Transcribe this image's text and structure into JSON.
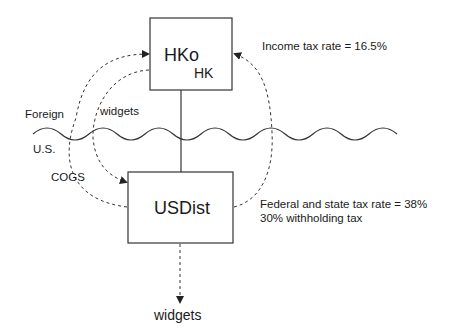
{
  "diagram": {
    "entities": [
      {
        "id": "hko",
        "name": "HKo",
        "jurisdiction": "HK"
      },
      {
        "id": "usdist",
        "name": "USDist"
      }
    ],
    "regions": {
      "upper": "Foreign",
      "lower": "U.S."
    },
    "flows": {
      "widgets_to_usdist": "widgets",
      "cogs_to_hko": "COGS",
      "widgets_out": "widgets"
    },
    "annotations": {
      "hko_tax": "Income tax rate = 16.5%",
      "usdist_tax_line1": "Federal and state tax rate = 38%",
      "usdist_tax_line2": "30% withholding tax"
    },
    "colors": {
      "stroke": "#333333",
      "text": "#1a1a1a"
    }
  }
}
